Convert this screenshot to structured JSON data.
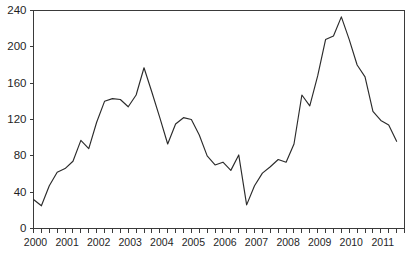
{
  "chart_data": {
    "type": "line",
    "title": "",
    "subtitle": "",
    "xlabel": "",
    "ylabel": "",
    "xlim": [
      2000.0,
      2011.75
    ],
    "ylim": [
      0,
      240
    ],
    "yticks": [
      0,
      40,
      80,
      120,
      160,
      200,
      240
    ],
    "ytick_labels": [
      "0",
      "40",
      "80",
      "120",
      "160",
      "200",
      "240"
    ],
    "xticks": [
      2000,
      2001,
      2002,
      2003,
      2004,
      2005,
      2006,
      2007,
      2008,
      2009,
      2010,
      2011
    ],
    "xtick_labels": [
      "2000",
      "2001",
      "2002",
      "2003",
      "2004",
      "2005",
      "2006",
      "2007",
      "2008",
      "2009",
      "2010",
      "2011"
    ],
    "x_minor_tick_interval": 0.25,
    "grid": false,
    "legend": false,
    "legend_position": "none",
    "series": [
      {
        "name": "value",
        "color": "#2b2b2b",
        "x": [
          2000.0,
          2000.25,
          2000.5,
          2000.75,
          2001.0,
          2001.25,
          2001.5,
          2001.75,
          2002.0,
          2002.25,
          2002.5,
          2002.75,
          2003.0,
          2003.25,
          2003.5,
          2003.75,
          2004.0,
          2004.25,
          2004.5,
          2004.75,
          2005.0,
          2005.25,
          2005.5,
          2005.75,
          2006.0,
          2006.25,
          2006.5,
          2006.75,
          2007.0,
          2007.25,
          2007.5,
          2007.75,
          2008.0,
          2008.25,
          2008.5,
          2008.75,
          2009.0,
          2009.25,
          2009.5,
          2009.75,
          2010.0,
          2010.25,
          2010.5,
          2010.75,
          2011.0,
          2011.25,
          2011.5
        ],
        "values": [
          32,
          25,
          47,
          62,
          66,
          74,
          97,
          88,
          117,
          140,
          143,
          142,
          134,
          147,
          177,
          150,
          122,
          93,
          115,
          122,
          120,
          103,
          80,
          70,
          73,
          64,
          81,
          26,
          47,
          61,
          68,
          76,
          73,
          93,
          147,
          135,
          168,
          208,
          212,
          233,
          208,
          180,
          167,
          129,
          119,
          114,
          96
        ]
      }
    ]
  }
}
